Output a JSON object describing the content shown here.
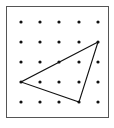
{
  "diagram": {
    "type": "geoboard-dot-grid",
    "frame": {
      "x": 6,
      "y": 6,
      "width": 102,
      "height": 111,
      "stroke": "#555555"
    },
    "grid": {
      "columns": 5,
      "rows": 5,
      "x_positions": [
        21,
        40,
        59,
        79,
        98
      ],
      "y_positions": [
        22,
        42,
        62,
        82,
        102
      ],
      "dot_color": "#111111",
      "dot_radius": 1.6
    },
    "triangle": {
      "vertices_grid": [
        [
          4,
          1
        ],
        [
          0,
          3
        ],
        [
          3,
          4
        ]
      ],
      "stroke": "#111111",
      "stroke_width": 1.1
    }
  }
}
